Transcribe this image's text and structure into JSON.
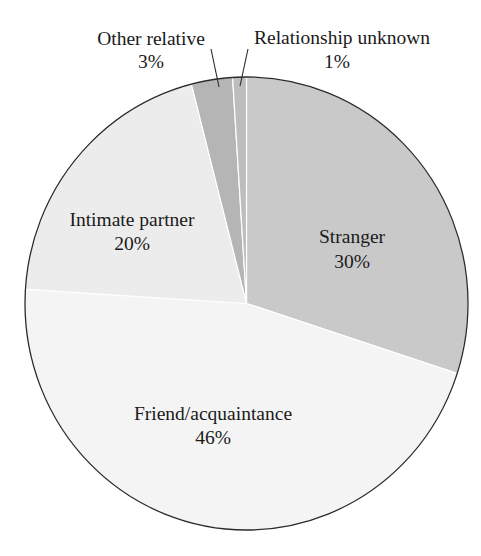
{
  "chart_data": {
    "type": "pie",
    "title": "",
    "start_angle_deg": 0,
    "direction": "clockwise",
    "slices": [
      {
        "label": "Stranger",
        "value": 30,
        "display": "30%",
        "color": "#c9c9c9"
      },
      {
        "label": "Friend/acquaintance",
        "value": 46,
        "display": "46%",
        "color": "#f4f4f4"
      },
      {
        "label": "Intimate partner",
        "value": 20,
        "display": "20%",
        "color": "#ececec"
      },
      {
        "label": "Other relative",
        "value": 3,
        "display": "3%",
        "color": "#b5b5b5"
      },
      {
        "label": "Relationship unknown",
        "value": 1,
        "display": "1%",
        "color": "#bdbdbd"
      }
    ]
  },
  "geometry": {
    "cx": 246.5,
    "cy": 303.5,
    "rx": 221.5,
    "ry": 226.5,
    "outline_color": "#2a2a2a",
    "separator_color": "#ffffff"
  },
  "labels": [
    {
      "slice": 0,
      "name_x": 352,
      "name_y": 243,
      "pct_x": 352,
      "pct_y": 268
    },
    {
      "slice": 1,
      "name_x": 213,
      "name_y": 420,
      "pct_x": 213,
      "pct_y": 444
    },
    {
      "slice": 2,
      "name_x": 132,
      "name_y": 226,
      "pct_x": 132,
      "pct_y": 250
    },
    {
      "slice": 3,
      "name_x": 151,
      "name_y": 45,
      "pct_x": 151,
      "pct_y": 68,
      "leader": [
        211,
        49,
        219,
        87
      ]
    },
    {
      "slice": 4,
      "name_x": 342,
      "name_y": 44,
      "pct_x": 337,
      "pct_y": 68,
      "leader": [
        248,
        49,
        240,
        86
      ]
    }
  ]
}
